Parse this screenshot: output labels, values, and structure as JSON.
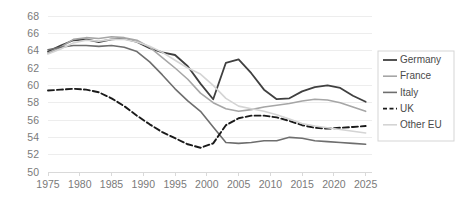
{
  "chart_data": {
    "type": "line",
    "title": "",
    "subtitle": "",
    "xlabel": "",
    "ylabel": "",
    "xlim": [
      1975,
      2026
    ],
    "ylim": [
      50,
      68
    ],
    "grid": true,
    "legend_position": "right",
    "x_ticks": [
      "1975",
      "1980",
      "1985",
      "1990",
      "1995",
      "2000",
      "2005",
      "2010",
      "2015",
      "2020",
      "2025"
    ],
    "x_tick_values": [
      1975,
      1980,
      1985,
      1990,
      1995,
      2000,
      2005,
      2010,
      2015,
      2020,
      2025
    ],
    "y_ticks": [
      "68",
      "66",
      "64",
      "62",
      "60",
      "58",
      "56",
      "54",
      "52",
      "50"
    ],
    "y_tick_values": [
      68,
      66,
      64,
      62,
      60,
      58,
      56,
      54,
      52,
      50
    ],
    "x": [
      1975,
      1977,
      1979,
      1981,
      1983,
      1985,
      1987,
      1989,
      1991,
      1993,
      1995,
      1997,
      1999,
      2001,
      2003,
      2005,
      2007,
      2009,
      2011,
      2013,
      2015,
      2017,
      2019,
      2021,
      2023,
      2025
    ],
    "series": [
      {
        "name": "Germany",
        "color": "#404040",
        "width": 1.8,
        "dash": "none",
        "values": [
          63.9,
          64.6,
          65.2,
          65.3,
          65.0,
          65.3,
          65.4,
          65.0,
          64.3,
          63.8,
          63.5,
          62.2,
          60.2,
          58.4,
          62.6,
          63.0,
          61.4,
          59.5,
          58.4,
          58.5,
          59.3,
          59.8,
          60.0,
          59.7,
          58.8,
          58.1
        ]
      },
      {
        "name": "France",
        "color": "#a6a6a6",
        "width": 1.6,
        "dash": "none",
        "values": [
          63.7,
          64.4,
          65.3,
          65.5,
          65.4,
          65.6,
          65.5,
          65.2,
          64.4,
          63.2,
          62.0,
          60.7,
          59.1,
          58.0,
          57.3,
          57.0,
          57.2,
          57.5,
          57.7,
          57.9,
          58.2,
          58.4,
          58.3,
          58.0,
          57.5,
          57.0
        ]
      },
      {
        "name": "Italy",
        "color": "#6e6e6e",
        "width": 1.6,
        "dash": "none",
        "values": [
          64.1,
          64.4,
          64.6,
          64.6,
          64.5,
          64.6,
          64.4,
          63.9,
          62.7,
          61.2,
          59.6,
          58.2,
          57.0,
          55.2,
          53.4,
          53.3,
          53.4,
          53.6,
          53.6,
          54.0,
          53.9,
          53.6,
          53.5,
          53.4,
          53.3,
          53.2
        ]
      },
      {
        "name": "UK",
        "color": "#1a1a1a",
        "width": 1.9,
        "dash": "6,3",
        "values": [
          59.4,
          59.5,
          59.6,
          59.5,
          59.2,
          58.5,
          57.6,
          56.5,
          55.5,
          54.6,
          53.9,
          53.2,
          52.8,
          53.3,
          55.4,
          56.2,
          56.5,
          56.5,
          56.3,
          55.9,
          55.4,
          55.1,
          55.0,
          55.1,
          55.2,
          55.3
        ]
      },
      {
        "name": "Other EU",
        "color": "#d4d4d4",
        "width": 1.6,
        "dash": "none",
        "values": [
          63.6,
          64.2,
          64.9,
          65.2,
          65.1,
          65.3,
          65.3,
          65.0,
          64.5,
          63.8,
          62.9,
          62.0,
          61.3,
          60.0,
          58.5,
          57.6,
          57.3,
          57.0,
          56.6,
          56.1,
          55.6,
          55.3,
          55.1,
          54.9,
          54.7,
          54.5
        ]
      }
    ],
    "legend": [
      {
        "label": "Germany",
        "color": "#404040",
        "dash": "none",
        "width": 1.8
      },
      {
        "label": "France",
        "color": "#a6a6a6",
        "dash": "none",
        "width": 1.6
      },
      {
        "label": "Italy",
        "color": "#6e6e6e",
        "dash": "none",
        "width": 1.6
      },
      {
        "label": "UK",
        "color": "#1a1a1a",
        "dash": "4,2.5",
        "width": 1.9
      },
      {
        "label": "Other EU",
        "color": "#d4d4d4",
        "dash": "none",
        "width": 1.6
      }
    ]
  }
}
